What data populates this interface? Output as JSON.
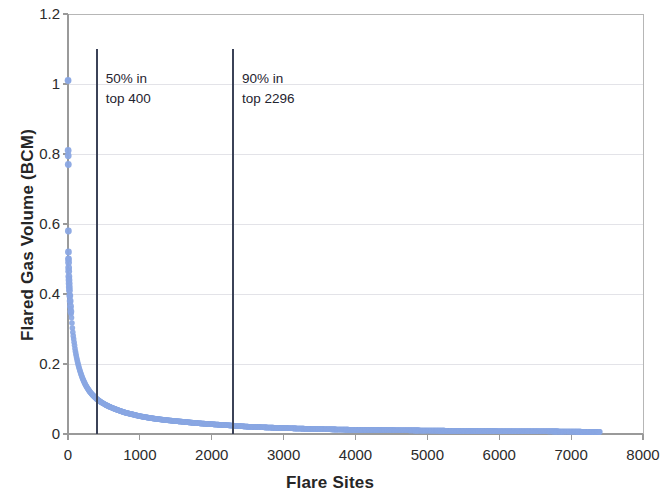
{
  "chart_data": {
    "type": "scatter",
    "title": "",
    "xlabel": "Flare Sites",
    "ylabel": "Flared Gas Volume (BCM)",
    "xlim": [
      0,
      8000
    ],
    "ylim": [
      0,
      1.2
    ],
    "xticks": [
      0,
      1000,
      2000,
      3000,
      4000,
      5000,
      6000,
      7000,
      8000
    ],
    "xtick_labels": [
      "0",
      "1000",
      "2000",
      "3000",
      "4000",
      "5000",
      "6000",
      "7000",
      "8000"
    ],
    "yticks": [
      0,
      0.2,
      0.4,
      0.6,
      0.8,
      1,
      1.2
    ],
    "ytick_labels": [
      "0",
      "0.2",
      "0.4",
      "0.6",
      "0.8",
      "1",
      "1.2"
    ],
    "grid": "horizontal",
    "legend": "none",
    "marker_color": "#8AA7E3",
    "marker_size": 3.2,
    "series": [
      {
        "name": "Flared gas volume per site (rank ordered)",
        "n_points": 7400,
        "x_max_data": 7400,
        "points": [
          [
            1,
            1.01
          ],
          [
            2,
            0.81
          ],
          [
            3,
            0.795
          ],
          [
            4,
            0.77
          ],
          [
            5,
            0.58
          ],
          [
            6,
            0.52
          ],
          [
            7,
            0.5
          ],
          [
            8,
            0.49
          ],
          [
            9,
            0.475
          ],
          [
            10,
            0.465
          ],
          [
            12,
            0.45
          ],
          [
            14,
            0.44
          ],
          [
            16,
            0.43
          ],
          [
            18,
            0.42
          ],
          [
            20,
            0.41
          ],
          [
            25,
            0.395
          ],
          [
            30,
            0.38
          ],
          [
            35,
            0.365
          ],
          [
            40,
            0.35
          ],
          [
            50,
            0.33
          ],
          [
            60,
            0.305
          ],
          [
            70,
            0.285
          ],
          [
            80,
            0.27
          ],
          [
            90,
            0.255
          ],
          [
            100,
            0.24
          ],
          [
            120,
            0.218
          ],
          [
            140,
            0.2
          ],
          [
            160,
            0.185
          ],
          [
            180,
            0.172
          ],
          [
            200,
            0.16
          ],
          [
            250,
            0.138
          ],
          [
            300,
            0.122
          ],
          [
            350,
            0.11
          ],
          [
            400,
            0.1
          ],
          [
            500,
            0.086
          ],
          [
            600,
            0.076
          ],
          [
            700,
            0.068
          ],
          [
            800,
            0.061
          ],
          [
            900,
            0.056
          ],
          [
            1000,
            0.051
          ],
          [
            1200,
            0.044
          ],
          [
            1400,
            0.039
          ],
          [
            1600,
            0.035
          ],
          [
            1800,
            0.031
          ],
          [
            2000,
            0.028
          ],
          [
            2296,
            0.024
          ],
          [
            2500,
            0.021
          ],
          [
            3000,
            0.017
          ],
          [
            3500,
            0.014
          ],
          [
            4000,
            0.012
          ],
          [
            4500,
            0.011
          ],
          [
            5000,
            0.01
          ],
          [
            5500,
            0.009
          ],
          [
            6000,
            0.008
          ],
          [
            6500,
            0.008
          ],
          [
            7000,
            0.007
          ],
          [
            7400,
            0.006
          ]
        ]
      }
    ],
    "annotations": [
      {
        "id": "p50",
        "line_x": 400,
        "line_y_top": 1.1,
        "line_y_bottom": 0,
        "text_line1": "50% in",
        "text_line2": "top 400",
        "percent": "50%",
        "rank": 400,
        "color": "#3b4257"
      },
      {
        "id": "p90",
        "line_x": 2296,
        "line_y_top": 1.1,
        "line_y_bottom": 0,
        "text_line1": "90% in",
        "text_line2": "top 2296",
        "percent": "90%",
        "rank": 2296,
        "color": "#3b4257"
      }
    ],
    "colors": {
      "marker": "#8AA7E3",
      "annotation_line": "#3b4257",
      "grid": "#e3e3e8",
      "axis": "#9a9a9a",
      "plot_border": "#b6b6b6",
      "text": "#2b2b2b"
    }
  }
}
